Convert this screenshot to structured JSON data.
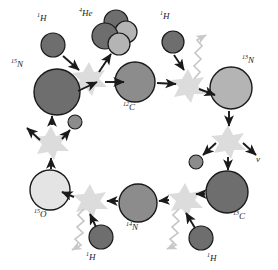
{
  "diagram": {
    "type": "nuclear-reaction-cycle",
    "background": "#ffffff",
    "palette": {
      "nucleus_dark": "#6e6e6e",
      "nucleus_medium": "#8c8c8c",
      "nucleus_light": "#b4b4b4",
      "nucleus_lighter": "#d6d6d6",
      "nucleus_pale": "#e4e4e4",
      "star_burst": "#dcdcdc",
      "arrow": "#1a1a1a",
      "gamma": "#c8c8c8",
      "outline": "#1a1a1a",
      "label_text": "#1a1a1a"
    },
    "nuclei": [
      {
        "id": "n15",
        "label_sup": "15",
        "label_base": "N",
        "cx": 57,
        "cy": 92,
        "r": 23,
        "fill": "#6e6e6e",
        "label_x": 12,
        "label_y": 64
      },
      {
        "id": "c12",
        "label_sup": "12",
        "label_base": "C",
        "cx": 135,
        "cy": 82,
        "r": 20,
        "fill": "#8c8c8c",
        "label_x": 124,
        "label_y": 107
      },
      {
        "id": "n13",
        "label_sup": "13",
        "label_base": "N",
        "cx": 231,
        "cy": 88,
        "r": 21,
        "fill": "#b4b4b4",
        "label_x": 243,
        "label_y": 60
      },
      {
        "id": "c13",
        "label_sup": "13",
        "label_base": "C",
        "cx": 227,
        "cy": 192,
        "r": 21,
        "fill": "#6e6e6e",
        "label_x": 234,
        "label_y": 216
      },
      {
        "id": "n14",
        "label_sup": "14",
        "label_base": "N",
        "cx": 138,
        "cy": 203,
        "r": 19,
        "fill": "#8c8c8c",
        "label_x": 127,
        "label_y": 227
      },
      {
        "id": "o15",
        "label_sup": "15",
        "label_base": "O",
        "cx": 50,
        "cy": 190,
        "r": 20,
        "fill": "#e4e4e4",
        "label_x": 36,
        "label_y": 214
      }
    ],
    "protons": [
      {
        "id": "h-top-left",
        "label_sup": "1",
        "label_base": "H",
        "cx": 53,
        "cy": 45,
        "r": 12,
        "fill": "#6e6e6e",
        "label_x": 40,
        "label_y": 22
      },
      {
        "id": "h-top-right",
        "label_sup": "1",
        "label_base": "H",
        "cx": 173,
        "cy": 42,
        "r": 11,
        "fill": "#6e6e6e",
        "label_x": 163,
        "label_y": 20
      },
      {
        "id": "h-bottom-left",
        "label_sup": "1",
        "label_base": "H",
        "cx": 101,
        "cy": 237,
        "r": 12,
        "fill": "#6e6e6e",
        "label_x": 87,
        "label_y": 258
      },
      {
        "id": "h-bottom-right",
        "label_sup": "1",
        "label_base": "H",
        "cx": 201,
        "cy": 238,
        "r": 12,
        "fill": "#6e6e6e",
        "label_x": 208,
        "label_y": 259
      }
    ],
    "helium": {
      "id": "he4",
      "label_sup": "4",
      "label_base": "He",
      "label_x": 84,
      "label_y": 17,
      "circles": [
        {
          "cx": 116,
          "cy": 22,
          "r": 12,
          "fill": "#6e6e6e"
        },
        {
          "cx": 126,
          "cy": 32,
          "r": 11,
          "fill": "#b4b4b4"
        },
        {
          "cx": 105,
          "cy": 36,
          "r": 13,
          "fill": "#6e6e6e"
        },
        {
          "cx": 119,
          "cy": 44,
          "r": 11,
          "fill": "#b4b4b4"
        }
      ]
    },
    "positrons": [
      {
        "id": "positron-left",
        "cx": 75,
        "cy": 122,
        "r": 7,
        "fill": "#8c8c8c"
      },
      {
        "id": "positron-right",
        "cx": 196,
        "cy": 162,
        "r": 7,
        "fill": "#8c8c8c"
      }
    ],
    "neutrinos": [
      {
        "id": "neutrino-right",
        "label": "ν",
        "x": 254,
        "y": 155
      },
      {
        "id": "neutrino-left",
        "label": "",
        "x": 0,
        "y": 0
      }
    ],
    "reaction_sites": [
      {
        "id": "fusion-n15-h",
        "cx": 89,
        "cy": 78,
        "kind": "fusion"
      },
      {
        "id": "fusion-c12-h",
        "cx": 188,
        "cy": 85,
        "kind": "fusion"
      },
      {
        "id": "decay-n13",
        "cx": 228,
        "cy": 141,
        "kind": "beta-decay"
      },
      {
        "id": "fusion-c13-h",
        "cx": 185,
        "cy": 199,
        "kind": "fusion"
      },
      {
        "id": "fusion-n14-h",
        "cx": 90,
        "cy": 200,
        "kind": "fusion"
      },
      {
        "id": "decay-o15",
        "cx": 51,
        "cy": 142,
        "kind": "beta-decay"
      }
    ],
    "gamma_rays": [
      {
        "id": "gamma-top-right",
        "x1": 196,
        "y1": 78,
        "x2": 214,
        "y2": 34
      },
      {
        "id": "gamma-bottom-right",
        "x1": 178,
        "y1": 208,
        "x2": 160,
        "y2": 248
      },
      {
        "id": "gamma-bottom-left",
        "x1": 83,
        "y1": 208,
        "x2": 66,
        "y2": 249
      }
    ]
  }
}
